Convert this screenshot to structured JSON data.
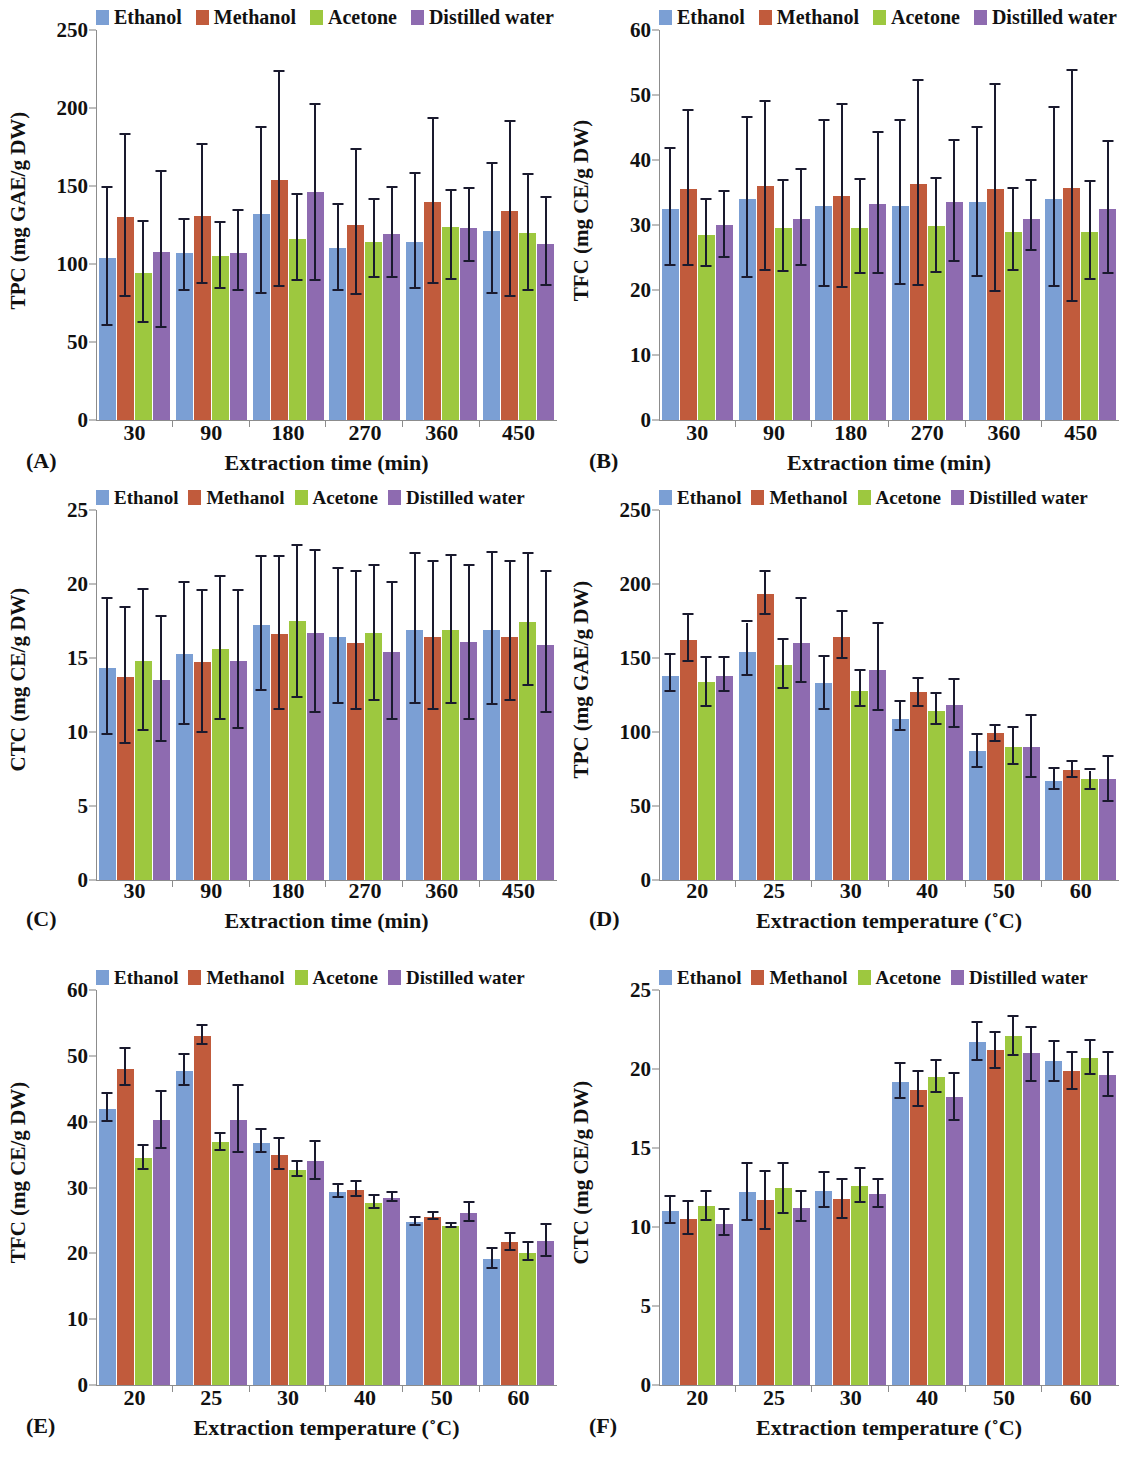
{
  "series_colors": {
    "Ethanol": "#7b9fd4",
    "Methanol": "#c15b3c",
    "Acetone": "#9dc83f",
    "Distilled water": "#8e6bb0"
  },
  "legend": {
    "items": [
      {
        "label": "Ethanol",
        "color": "#7b9fd4"
      },
      {
        "label": "Methanol",
        "color": "#c15b3c"
      },
      {
        "label": "Acetone",
        "color": "#9dc83f"
      },
      {
        "label": "Distilled water",
        "color": "#8e6bb0"
      }
    ]
  },
  "panels": [
    {
      "letter": "(A)",
      "chart_data": {
        "type": "bar",
        "title": "",
        "xlabel": "Extraction time (min)",
        "ylabel": "TPC (mg GAE/g DW)",
        "categories": [
          "30",
          "90",
          "180",
          "270",
          "360",
          "450"
        ],
        "ylim": [
          0,
          250
        ],
        "yticks": [
          0,
          50,
          100,
          150,
          200,
          250
        ],
        "grid": false,
        "legend_position": "top",
        "series": [
          {
            "name": "Ethanol",
            "values": [
              104,
              107,
              132,
              110,
              114,
              121
            ],
            "err_low": [
              44,
              24,
              51,
              27,
              30,
              40
            ],
            "err_high": [
              45,
              21,
              55,
              28,
              44,
              43
            ]
          },
          {
            "name": "Methanol",
            "values": [
              130,
              131,
              154,
              125,
              140,
              134
            ],
            "err_low": [
              51,
              44,
              69,
              45,
              53,
              55
            ],
            "err_high": [
              53,
              45,
              69,
              48,
              53,
              57
            ]
          },
          {
            "name": "Acetone",
            "values": [
              94,
              105,
              116,
              114,
              124,
              120
            ],
            "err_low": [
              32,
              21,
              27,
              23,
              34,
              37
            ],
            "err_high": [
              33,
              21,
              28,
              27,
              23,
              37
            ]
          },
          {
            "name": "Distilled water",
            "values": [
              108,
              107,
              146,
              119,
              123,
              113
            ],
            "err_low": [
              49,
              24,
              57,
              28,
              22,
              27
            ],
            "err_high": [
              51,
              27,
              56,
              30,
              25,
              29
            ]
          }
        ]
      }
    },
    {
      "letter": "(B)",
      "chart_data": {
        "type": "bar",
        "title": "",
        "xlabel": "Extraction time (min)",
        "ylabel": "TFC (mg CE/g DW)",
        "categories": [
          "30",
          "90",
          "180",
          "270",
          "360",
          "450"
        ],
        "ylim": [
          0,
          60
        ],
        "yticks": [
          0,
          10,
          20,
          30,
          40,
          50,
          60
        ],
        "grid": false,
        "legend_position": "top",
        "series": [
          {
            "name": "Ethanol",
            "values": [
              32.5,
              34.0,
              33.0,
              33.0,
              33.5,
              34.0
            ],
            "err_low": [
              8.8,
              12.2,
              12.5,
              12.3,
              11.5,
              13.5
            ],
            "err_high": [
              9.2,
              12.4,
              13.0,
              13.0,
              11.5,
              14.0
            ]
          },
          {
            "name": "Methanol",
            "values": [
              35.5,
              36.0,
              34.5,
              36.3,
              35.5,
              35.7
            ],
            "err_low": [
              11.8,
              13.0,
              14.2,
              15.7,
              15.8,
              17.5
            ],
            "err_high": [
              12.0,
              12.9,
              14.0,
              15.8,
              16.0,
              18.0
            ]
          },
          {
            "name": "Acetone",
            "values": [
              28.5,
              29.5,
              29.5,
              29.8,
              29.0,
              29.0
            ],
            "err_low": [
              5.0,
              6.8,
              7.0,
              7.2,
              6.0,
              7.4
            ],
            "err_high": [
              5.3,
              7.2,
              7.5,
              7.3,
              6.5,
              7.6
            ]
          },
          {
            "name": "Distilled water",
            "values": [
              30.0,
              31.0,
              33.2,
              33.5,
              31.0,
              32.5
            ],
            "err_low": [
              5.0,
              7.3,
              10.8,
              9.2,
              5.0,
              10.0
            ],
            "err_high": [
              5.1,
              7.4,
              11.0,
              9.4,
              5.8,
              10.2
            ]
          }
        ]
      }
    },
    {
      "letter": "(C)",
      "chart_data": {
        "type": "bar",
        "title": "",
        "xlabel": "Extraction time (min)",
        "ylabel": "CTC (mg CE/g DW)",
        "categories": [
          "30",
          "90",
          "180",
          "270",
          "360",
          "450"
        ],
        "ylim": [
          0,
          25
        ],
        "yticks": [
          0,
          5,
          10,
          15,
          20,
          25
        ],
        "grid": false,
        "legend_position": "top",
        "series": [
          {
            "name": "Ethanol",
            "values": [
              14.3,
              15.3,
              17.2,
              16.4,
              16.9,
              16.9
            ],
            "err_low": [
              4.5,
              4.8,
              4.4,
              4.5,
              5.0,
              5.1
            ],
            "err_high": [
              4.7,
              4.8,
              4.6,
              4.6,
              5.1,
              5.2
            ]
          },
          {
            "name": "Methanol",
            "values": [
              13.7,
              14.7,
              16.6,
              16.0,
              16.4,
              16.4
            ],
            "err_low": [
              4.5,
              4.8,
              5.1,
              4.5,
              4.9,
              4.3
            ],
            "err_high": [
              4.7,
              4.8,
              5.2,
              4.8,
              5.1,
              5.1
            ]
          },
          {
            "name": "Acetone",
            "values": [
              14.8,
              15.6,
              17.5,
              16.7,
              16.9,
              17.4
            ],
            "err_low": [
              4.7,
              4.8,
              5.2,
              4.6,
              5.0,
              4.3
            ],
            "err_high": [
              4.8,
              4.9,
              5.1,
              4.5,
              5.0,
              4.6
            ]
          },
          {
            "name": "Distilled water",
            "values": [
              13.5,
              14.8,
              16.7,
              15.4,
              16.1,
              15.9
            ],
            "err_low": [
              4.2,
              4.6,
              5.4,
              4.6,
              5.3,
              4.6
            ],
            "err_high": [
              4.3,
              4.7,
              5.5,
              4.7,
              5.1,
              4.9
            ]
          }
        ]
      }
    },
    {
      "letter": "(D)",
      "chart_data": {
        "type": "bar",
        "title": "",
        "xlabel": "Extraction temperature (˚C)",
        "ylabel": "TPC (mg GAE/g DW)",
        "categories": [
          "20",
          "25",
          "30",
          "40",
          "50",
          "60"
        ],
        "ylim": [
          0,
          250
        ],
        "yticks": [
          0,
          50,
          100,
          150,
          200,
          250
        ],
        "grid": false,
        "legend_position": "top",
        "series": [
          {
            "name": "Ethanol",
            "values": [
              138,
              154,
              133,
              109,
              87,
              67
            ],
            "err_low": [
              11,
              16,
              18,
              8,
              11,
              6
            ],
            "err_high": [
              14,
              20,
              18,
              11,
              11,
              8
            ]
          },
          {
            "name": "Methanol",
            "values": [
              162,
              193,
              164,
              127,
              99,
              74
            ],
            "err_low": [
              15,
              14,
              15,
              10,
              6,
              5
            ],
            "err_high": [
              17,
              15,
              17,
              9,
              5,
              6
            ]
          },
          {
            "name": "Acetone",
            "values": [
              134,
              145,
              128,
              114,
              90,
              68
            ],
            "err_low": [
              17,
              16,
              11,
              9,
              12,
              7
            ],
            "err_high": [
              16,
              17,
              13,
              12,
              13,
              6
            ]
          },
          {
            "name": "Distilled water",
            "values": [
              138,
              160,
              142,
              118,
              90,
              68
            ],
            "err_low": [
              11,
              27,
              28,
              15,
              21,
              15
            ],
            "err_high": [
              12,
              30,
              31,
              17,
              21,
              15
            ]
          }
        ]
      }
    },
    {
      "letter": "(E)",
      "chart_data": {
        "type": "bar",
        "title": "",
        "xlabel": "Extraction temperature (˚C)",
        "ylabel": "TFC (mg CE/g DW)",
        "categories": [
          "20",
          "25",
          "30",
          "40",
          "50",
          "60"
        ],
        "ylim": [
          0,
          60
        ],
        "yticks": [
          0,
          10,
          20,
          30,
          40,
          50,
          60
        ],
        "grid": false,
        "legend_position": "top",
        "series": [
          {
            "name": "Ethanol",
            "values": [
              42.0,
              47.7,
              36.8,
              29.3,
              24.7,
              19.2
            ],
            "err_low": [
              2.0,
              2.3,
              1.5,
              0.9,
              0.5,
              1.6
            ],
            "err_high": [
              2.2,
              2.5,
              1.9,
              1.1,
              0.6,
              1.5
            ]
          },
          {
            "name": "Methanol",
            "values": [
              48.0,
              53.0,
              35.0,
              29.6,
              25.5,
              21.7
            ],
            "err_low": [
              2.6,
              1.3,
              2.3,
              1.1,
              0.5,
              1.3
            ],
            "err_high": [
              3.0,
              1.5,
              2.4,
              1.2,
              0.6,
              1.3
            ]
          },
          {
            "name": "Acetone",
            "values": [
              34.5,
              36.9,
              32.7,
              27.7,
              24.2,
              20.0
            ],
            "err_low": [
              1.8,
              1.3,
              1.1,
              1.0,
              0.3,
              1.1
            ],
            "err_high": [
              1.8,
              1.3,
              1.2,
              1.0,
              0.3,
              1.6
            ]
          },
          {
            "name": "Distilled water",
            "values": [
              40.2,
              40.2,
              34.0,
              28.4,
              26.2,
              21.9
            ],
            "err_low": [
              4.3,
              5.0,
              2.8,
              0.6,
              1.4,
              2.4
            ],
            "err_high": [
              4.3,
              5.2,
              2.9,
              0.7,
              1.4,
              2.4
            ]
          }
        ]
      }
    },
    {
      "letter": "(F)",
      "chart_data": {
        "type": "bar",
        "title": "",
        "xlabel": "Extraction temperature (˚C)",
        "ylabel": "CTC (mg CE/g DW)",
        "categories": [
          "20",
          "25",
          "30",
          "40",
          "50",
          "60"
        ],
        "ylim": [
          0,
          25
        ],
        "yticks": [
          0,
          5,
          10,
          15,
          20,
          25
        ],
        "grid": false,
        "legend_position": "top",
        "series": [
          {
            "name": "Ethanol",
            "values": [
              11.0,
              12.2,
              12.3,
              19.2,
              21.7,
              20.5
            ],
            "err_low": [
              0.8,
              1.8,
              1.1,
              1.1,
              1.2,
              1.3
            ],
            "err_high": [
              0.9,
              1.8,
              1.1,
              1.1,
              1.2,
              1.2
            ]
          },
          {
            "name": "Methanol",
            "values": [
              10.5,
              11.7,
              11.8,
              18.7,
              21.2,
              19.9
            ],
            "err_low": [
              1.0,
              1.9,
              1.3,
              1.1,
              1.2,
              1.2
            ],
            "err_high": [
              1.1,
              1.8,
              1.2,
              1.1,
              1.1,
              1.1
            ]
          },
          {
            "name": "Acetone",
            "values": [
              11.3,
              12.5,
              12.6,
              19.5,
              22.1,
              20.7
            ],
            "err_low": [
              0.9,
              1.7,
              1.1,
              1.0,
              1.3,
              1.1
            ],
            "err_high": [
              0.9,
              1.5,
              1.1,
              1.0,
              1.2,
              1.1
            ]
          },
          {
            "name": "Distilled water",
            "values": [
              10.2,
              11.2,
              12.1,
              18.2,
              21.0,
              19.6
            ],
            "err_low": [
              0.8,
              0.9,
              0.9,
              1.5,
              1.8,
              1.4
            ],
            "err_high": [
              0.9,
              1.0,
              0.9,
              1.5,
              1.6,
              1.4
            ]
          }
        ]
      }
    }
  ]
}
